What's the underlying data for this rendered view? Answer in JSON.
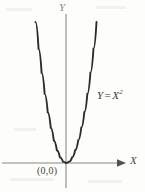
{
  "figure": {
    "background_color": "#fdfdfc"
  },
  "axes": {
    "x_label": "X",
    "y_label": "Y",
    "axis_color": "#8a8784",
    "x_axis": {
      "y_position": 163,
      "x_start": 2,
      "x_end": 126,
      "arrow": "right-arrowhead"
    },
    "y_axis": {
      "x_position": 66,
      "y_start": 14,
      "y_end": 188,
      "arrow": "none"
    }
  },
  "annotations": {
    "origin_label": "(0,0)",
    "equation": {
      "lhs": "Y",
      "operator": "=",
      "base": "X",
      "exponent": "2",
      "full": "Y = X²"
    }
  },
  "chart_data": {
    "type": "line",
    "xlabel": "X",
    "ylabel": "Y",
    "curve_color": "#2d2a28",
    "vertex": [
      0,
      0
    ],
    "xlim": [
      -1.05,
      1.05
    ],
    "ylim": [
      0,
      1.1
    ],
    "grid": false,
    "legend": "none",
    "x": [
      -1.0,
      -0.9,
      -0.8,
      -0.7,
      -0.6,
      -0.5,
      -0.4,
      -0.3,
      -0.2,
      -0.1,
      0.0,
      0.1,
      0.2,
      0.3,
      0.4,
      0.5,
      0.6,
      0.7,
      0.8,
      0.9,
      1.0
    ],
    "values": [
      1.0,
      0.81,
      0.64,
      0.49,
      0.36,
      0.25,
      0.16,
      0.09,
      0.04,
      0.01,
      0.0,
      0.01,
      0.04,
      0.09,
      0.16,
      0.25,
      0.36,
      0.49,
      0.64,
      0.81,
      1.0
    ]
  }
}
